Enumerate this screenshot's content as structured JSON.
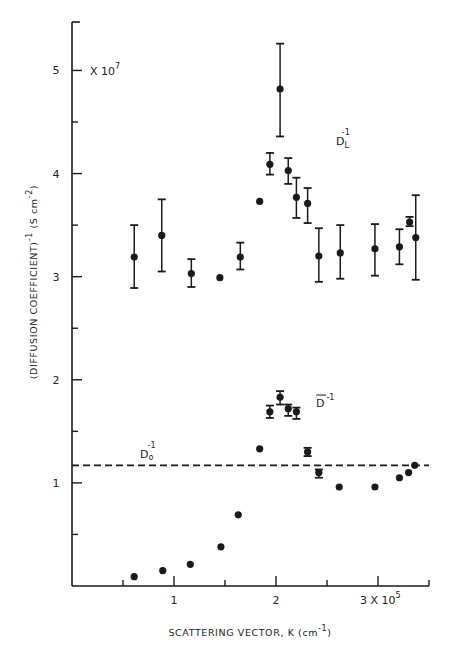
{
  "chart_data": {
    "type": "scatter",
    "title": "",
    "xlabel": "SCATTERING VECTOR, K (cm",
    "xlabel_sup": "-1",
    "xlabel_tail": ")",
    "ylabel": "(DIFFUSION  COEFFICIENT)",
    "ylabel_sup": "-1",
    "ylabel_units": " (S cm",
    "ylabel_units_sup": "-2",
    "ylabel_tail": ")",
    "y_multiplier": "X 10",
    "y_multiplier_exp": "7",
    "x_multiplier": "3 X 10",
    "x_multiplier_exp": "5",
    "xlim": [
      0,
      3.5
    ],
    "ylim": [
      0,
      5.47
    ],
    "grid": false,
    "x_ticks_major": [
      1,
      2,
      3
    ],
    "x_ticks_minor": [
      0.5,
      1.5,
      2.5,
      3.5
    ],
    "x_tick_labels": [
      "1",
      "2",
      ""
    ],
    "y_ticks_major": [
      1,
      2,
      3,
      4,
      5
    ],
    "y_ticks_minor": [
      0.5,
      1.5,
      2.5,
      3.5,
      4.5
    ],
    "y_tick_labels": [
      "1",
      "2",
      "3",
      "4",
      "5"
    ],
    "reference_line": {
      "name": "Do^-1",
      "label": "D",
      "label_sub": "o",
      "label_sup": "-1",
      "y": 1.17,
      "style": "dashed"
    },
    "series": [
      {
        "name": "DL^-1",
        "label": "D",
        "label_sub": "L",
        "label_sup": "-1",
        "points": [
          {
            "x": 0.61,
            "y": 3.19,
            "err_low": 2.89,
            "err_high": 3.5
          },
          {
            "x": 0.88,
            "y": 3.4,
            "err_low": 3.05,
            "err_high": 3.75
          },
          {
            "x": 1.17,
            "y": 3.03,
            "err_low": 2.9,
            "err_high": 3.17
          },
          {
            "x": 1.45,
            "y": 2.99
          },
          {
            "x": 1.65,
            "y": 3.19,
            "err_low": 3.07,
            "err_high": 3.33
          },
          {
            "x": 1.84,
            "y": 3.73
          },
          {
            "x": 1.94,
            "y": 4.09,
            "err_low": 3.99,
            "err_high": 4.2
          },
          {
            "x": 2.04,
            "y": 4.82,
            "err_low": 4.36,
            "err_high": 5.26
          },
          {
            "x": 2.12,
            "y": 4.03,
            "err_low": 3.9,
            "err_high": 4.15
          },
          {
            "x": 2.2,
            "y": 3.77,
            "err_low": 3.57,
            "err_high": 3.96
          },
          {
            "x": 2.31,
            "y": 3.71,
            "err_low": 3.52,
            "err_high": 3.86
          },
          {
            "x": 2.42,
            "y": 3.2,
            "err_low": 2.95,
            "err_high": 3.47
          },
          {
            "x": 2.63,
            "y": 3.23,
            "err_low": 2.98,
            "err_high": 3.5
          },
          {
            "x": 2.97,
            "y": 3.27,
            "err_low": 3.01,
            "err_high": 3.51
          },
          {
            "x": 3.21,
            "y": 3.29,
            "err_low": 3.12,
            "err_high": 3.46
          },
          {
            "x": 3.31,
            "y": 3.53,
            "err_low": 3.49,
            "err_high": 3.58
          },
          {
            "x": 3.37,
            "y": 3.38,
            "err_low": 2.97,
            "err_high": 3.79
          }
        ]
      },
      {
        "name": "Dbar^-1",
        "label": "D",
        "label_sup": "-1",
        "label_overbar": true,
        "points": [
          {
            "x": 0.61,
            "y": 0.09
          },
          {
            "x": 0.89,
            "y": 0.15
          },
          {
            "x": 1.16,
            "y": 0.21
          },
          {
            "x": 1.46,
            "y": 0.38
          },
          {
            "x": 1.63,
            "y": 0.69
          },
          {
            "x": 1.84,
            "y": 1.33
          },
          {
            "x": 1.94,
            "y": 1.69,
            "err_low": 1.63,
            "err_high": 1.75
          },
          {
            "x": 2.04,
            "y": 1.83,
            "err_low": 1.76,
            "err_high": 1.89
          },
          {
            "x": 2.12,
            "y": 1.72,
            "err_low": 1.65,
            "err_high": 1.76
          },
          {
            "x": 2.2,
            "y": 1.69,
            "err_low": 1.62,
            "err_high": 1.73
          },
          {
            "x": 2.31,
            "y": 1.3,
            "err_low": 1.26,
            "err_high": 1.34
          },
          {
            "x": 2.42,
            "y": 1.1,
            "err_low": 1.05,
            "err_high": 1.13
          },
          {
            "x": 2.62,
            "y": 0.96
          },
          {
            "x": 2.97,
            "y": 0.96
          },
          {
            "x": 3.21,
            "y": 1.05
          },
          {
            "x": 3.3,
            "y": 1.1
          },
          {
            "x": 3.36,
            "y": 1.17
          }
        ]
      }
    ],
    "colors": {
      "ink": "#1a1a1a",
      "background": "#ffffff"
    }
  }
}
